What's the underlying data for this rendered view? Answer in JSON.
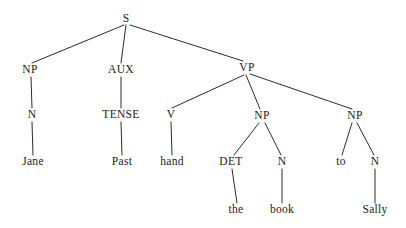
{
  "diagram": {
    "sentence": "Jane Past hand the book to Sally",
    "type": "constituency-parse-tree",
    "background_color": "#ffffff",
    "text_color": "#1a1a1a",
    "edge_color": "#2b2b2b",
    "nodes": [
      {
        "id": "s",
        "label": "S",
        "kind": "category",
        "x": 126,
        "y": 19
      },
      {
        "id": "np1",
        "label": "NP",
        "kind": "category",
        "x": 30,
        "y": 70
      },
      {
        "id": "aux",
        "label": "AUX",
        "kind": "category",
        "x": 121,
        "y": 70
      },
      {
        "id": "vp",
        "label": "VP",
        "kind": "category",
        "x": 247,
        "y": 68
      },
      {
        "id": "n1",
        "label": "N",
        "kind": "category",
        "x": 32,
        "y": 115
      },
      {
        "id": "tense",
        "label": "TENSE",
        "kind": "category",
        "x": 121,
        "y": 115
      },
      {
        "id": "v",
        "label": "V",
        "kind": "category",
        "x": 171,
        "y": 115
      },
      {
        "id": "np2",
        "label": "NP",
        "kind": "category",
        "x": 262,
        "y": 116
      },
      {
        "id": "np3",
        "label": "NP",
        "kind": "category",
        "x": 355,
        "y": 116
      },
      {
        "id": "jane",
        "label": "Jane",
        "kind": "word",
        "x": 33,
        "y": 162
      },
      {
        "id": "past",
        "label": "Past",
        "kind": "word",
        "x": 122,
        "y": 162
      },
      {
        "id": "hand",
        "label": "hand",
        "kind": "word",
        "x": 172,
        "y": 162
      },
      {
        "id": "det",
        "label": "DET",
        "kind": "category",
        "x": 231,
        "y": 162
      },
      {
        "id": "n2",
        "label": "N",
        "kind": "category",
        "x": 282,
        "y": 162
      },
      {
        "id": "to",
        "label": "to",
        "kind": "word",
        "x": 341,
        "y": 162
      },
      {
        "id": "n3",
        "label": "N",
        "kind": "category",
        "x": 375,
        "y": 162
      },
      {
        "id": "the",
        "label": "the",
        "kind": "word",
        "x": 236,
        "y": 210
      },
      {
        "id": "book",
        "label": "book",
        "kind": "word",
        "x": 282,
        "y": 210
      },
      {
        "id": "sally",
        "label": "Sally",
        "kind": "word",
        "x": 375,
        "y": 210
      }
    ],
    "edges": [
      {
        "from": "s",
        "to": "np1",
        "x1": 124,
        "y1": 25,
        "x2": 32,
        "y2": 63
      },
      {
        "from": "s",
        "to": "aux",
        "x1": 126,
        "y1": 25,
        "x2": 121,
        "y2": 63
      },
      {
        "from": "s",
        "to": "vp",
        "x1": 130,
        "y1": 25,
        "x2": 243,
        "y2": 61
      },
      {
        "from": "np1",
        "to": "n1",
        "x1": 31,
        "y1": 77,
        "x2": 32,
        "y2": 108
      },
      {
        "from": "aux",
        "to": "tense",
        "x1": 121,
        "y1": 77,
        "x2": 121,
        "y2": 108
      },
      {
        "from": "vp",
        "to": "v",
        "x1": 244,
        "y1": 75,
        "x2": 172,
        "y2": 108
      },
      {
        "from": "vp",
        "to": "np2",
        "x1": 246,
        "y1": 75,
        "x2": 260,
        "y2": 109
      },
      {
        "from": "vp",
        "to": "np3",
        "x1": 250,
        "y1": 74,
        "x2": 352,
        "y2": 109
      },
      {
        "from": "n1",
        "to": "jane",
        "x1": 32,
        "y1": 122,
        "x2": 33,
        "y2": 155
      },
      {
        "from": "tense",
        "to": "past",
        "x1": 121,
        "y1": 122,
        "x2": 122,
        "y2": 155
      },
      {
        "from": "v",
        "to": "hand",
        "x1": 171,
        "y1": 122,
        "x2": 172,
        "y2": 155
      },
      {
        "from": "np2",
        "to": "det",
        "x1": 259,
        "y1": 123,
        "x2": 234,
        "y2": 155
      },
      {
        "from": "np2",
        "to": "n2",
        "x1": 265,
        "y1": 123,
        "x2": 281,
        "y2": 155
      },
      {
        "from": "np3",
        "to": "to",
        "x1": 352,
        "y1": 123,
        "x2": 342,
        "y2": 155
      },
      {
        "from": "np3",
        "to": "n3",
        "x1": 357,
        "y1": 123,
        "x2": 374,
        "y2": 155
      },
      {
        "from": "det",
        "to": "the",
        "x1": 232,
        "y1": 169,
        "x2": 237,
        "y2": 203
      },
      {
        "from": "n2",
        "to": "book",
        "x1": 282,
        "y1": 169,
        "x2": 282,
        "y2": 203
      },
      {
        "from": "n3",
        "to": "sally",
        "x1": 375,
        "y1": 169,
        "x2": 375,
        "y2": 203
      }
    ]
  }
}
